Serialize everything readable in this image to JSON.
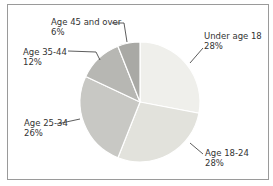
{
  "chart_data": {
    "type": "pie",
    "title": "",
    "categories": [
      "Under age 18",
      "Age 18-24",
      "Age 25-34",
      "Age 35-44",
      "Age 45 and over"
    ],
    "values": [
      28,
      28,
      26,
      12,
      6
    ],
    "unit": "%",
    "colors": [
      "#efefeb",
      "#e2e2dc",
      "#c8c8c4",
      "#b7b7b3",
      "#a9a9a5"
    ],
    "labels": [
      {
        "name": "Under age 18",
        "value": "28%"
      },
      {
        "name": "Age 18-24",
        "value": "28%"
      },
      {
        "name": "Age 25-34",
        "value": "26%"
      },
      {
        "name": "Age 35-44",
        "value": "12%"
      },
      {
        "name": "Age 45 and over",
        "value": "6%"
      }
    ]
  }
}
